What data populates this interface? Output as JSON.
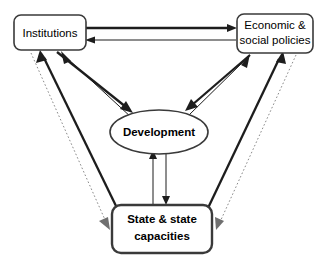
{
  "diagram": {
    "background_color": "#ffffff",
    "line_color": "#1d1d1d",
    "dotted_line_color": "#8a8a8a",
    "nodes": [
      {
        "id": "institutions",
        "label": "Institutions",
        "shape": "rounded-rectangle",
        "emphasis": "normal"
      },
      {
        "id": "economic-social-policies",
        "label_line1": "Economic &",
        "label_line2": "social policies",
        "shape": "rounded-rectangle",
        "emphasis": "normal"
      },
      {
        "id": "development",
        "label": "Development",
        "shape": "ellipse",
        "emphasis": "bold"
      },
      {
        "id": "state-capacities",
        "label_line1": "State & state",
        "label_line2": "capacities",
        "shape": "rounded-rectangle",
        "emphasis": "bold"
      }
    ],
    "edges": [
      {
        "id": "institutions-to-policies",
        "from": "institutions",
        "to": "economic-social-policies",
        "style": "thick-solid",
        "direction": "right"
      },
      {
        "id": "policies-to-institutions",
        "from": "economic-social-policies",
        "to": "institutions",
        "style": "thin-solid",
        "direction": "left"
      },
      {
        "id": "institutions-to-development",
        "from": "institutions",
        "to": "development",
        "style": "thick-solid",
        "direction": "down-right"
      },
      {
        "id": "development-to-institutions",
        "from": "development",
        "to": "institutions",
        "style": "thin-solid",
        "direction": "up-left"
      },
      {
        "id": "policies-to-development",
        "from": "economic-social-policies",
        "to": "development",
        "style": "thick-solid",
        "direction": "down-left"
      },
      {
        "id": "development-to-policies",
        "from": "development",
        "to": "economic-social-policies",
        "style": "thin-solid",
        "direction": "up-right"
      },
      {
        "id": "state-to-development",
        "from": "state-capacities",
        "to": "development",
        "style": "thin-solid",
        "direction": "up"
      },
      {
        "id": "development-to-state",
        "from": "development",
        "to": "state-capacities",
        "style": "thin-solid",
        "direction": "down"
      },
      {
        "id": "state-to-institutions",
        "from": "state-capacities",
        "to": "institutions",
        "style": "thick-solid",
        "direction": "up-left"
      },
      {
        "id": "institutions-to-state",
        "from": "institutions",
        "to": "state-capacities",
        "style": "dotted",
        "direction": "down-right"
      },
      {
        "id": "state-to-policies",
        "from": "state-capacities",
        "to": "economic-social-policies",
        "style": "thick-solid",
        "direction": "up-right"
      },
      {
        "id": "policies-to-state",
        "from": "economic-social-policies",
        "to": "state-capacities",
        "style": "dotted",
        "direction": "down-left"
      }
    ]
  }
}
